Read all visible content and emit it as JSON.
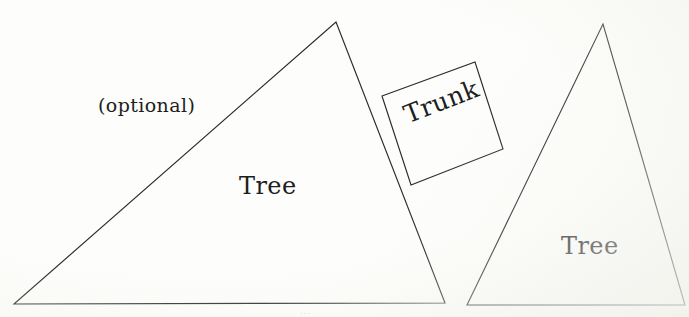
{
  "canvas": {
    "width": 689,
    "height": 317,
    "background_color": "#fdfdfb",
    "stroke_color": "#2b2b2e",
    "text_color": "#1e1e22"
  },
  "labels": {
    "optional": "(optional)",
    "tree_left": "Tree",
    "tree_right": "Tree",
    "trunk": "Trunk",
    "bottom_faint": "..."
  },
  "shapes": {
    "tree_left": {
      "type": "triangle",
      "label": "Tree",
      "points": "14,304 336,22 445,303"
    },
    "trunk": {
      "type": "square-rotated",
      "label": "Trunk",
      "rotation_deg": -21,
      "points": "382,96 475,62 503,149 411,185"
    },
    "tree_right": {
      "type": "triangle",
      "label": "Tree",
      "points": "467,305 603,24 685,305"
    }
  }
}
